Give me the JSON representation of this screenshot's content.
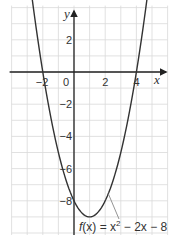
{
  "chart_data": {
    "type": "line",
    "title": "",
    "xlabel": "x",
    "ylabel": "y",
    "xlim": [
      -4,
      6
    ],
    "ylim": [
      -10,
      4
    ],
    "grid": true,
    "x_ticks_labeled": [
      -2,
      0,
      2,
      4
    ],
    "y_ticks_labeled": [
      2,
      -2,
      -4,
      -6,
      -8
    ],
    "x_tick_labels": [
      "−2",
      "0",
      "2",
      "4"
    ],
    "y_tick_labels": [
      "2",
      "−2",
      "−4",
      "−6",
      "−8"
    ],
    "series": [
      {
        "name": "f(x) = x^2 − 2x − 8",
        "function": "x^2 - 2x - 8",
        "coefficients": {
          "a": 1,
          "b": -2,
          "c": -8
        },
        "x_range": [
          -2.8,
          4.8
        ],
        "x": [
          -2.8,
          -2,
          -1,
          0,
          1,
          2,
          3,
          4,
          4.8
        ],
        "y": [
          5.44,
          0,
          -5,
          -8,
          -9,
          -8,
          -5,
          0,
          5.44
        ],
        "vertex": [
          1,
          -9
        ],
        "roots": [
          -2,
          4
        ],
        "y_intercept": -8,
        "arrows_at_ends": true
      }
    ],
    "annotations": [
      {
        "text_parts": [
          "f",
          "(x) = x",
          "2",
          " − 2x − 8"
        ],
        "points_to": [
          2.2,
          -7.4
        ]
      }
    ]
  },
  "labels": {
    "x_axis": "x",
    "y_axis": "y",
    "origin": "0",
    "function_label_f": "f",
    "function_label_mid": "(x) = x",
    "function_label_sup": "2",
    "function_label_end": " − 2x − 8"
  }
}
